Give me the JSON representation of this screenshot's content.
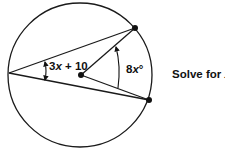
{
  "diagram": {
    "type": "circle-geometry",
    "circle": {
      "cx": 80,
      "cy": 75,
      "r": 72,
      "stroke": "#1a1a1a"
    },
    "points": {
      "center": {
        "x": 81,
        "y": 75
      },
      "left_vertex": {
        "x": 9,
        "y": 73
      },
      "top_point": {
        "x": 135,
        "y": 28
      },
      "bottom_point": {
        "x": 149,
        "y": 100
      }
    },
    "angles": {
      "inscribed": {
        "expr_prefix": "3",
        "var": "x",
        "expr_suffix": " + 10"
      },
      "central": {
        "coef": "8",
        "var": "x",
        "unit": "°"
      }
    },
    "prompt": {
      "text": "Solve for ",
      "var": "x",
      "unit": "°"
    }
  }
}
